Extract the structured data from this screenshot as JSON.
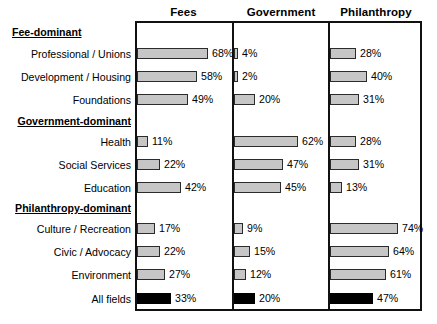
{
  "chart_data": {
    "type": "bar",
    "title": "",
    "subtitle": "",
    "xlabel": "",
    "ylabel": "",
    "xlim": [
      0,
      100
    ],
    "grid": false,
    "legend_position": "none",
    "orientation": "horizontal",
    "value_suffix": "%",
    "panels": [
      "Fees",
      "Government",
      "Philanthropy"
    ],
    "series": [
      {
        "name": "Fees",
        "values": [
          68,
          58,
          49,
          11,
          22,
          42,
          17,
          22,
          27
        ]
      },
      {
        "name": "Government",
        "values": [
          4,
          2,
          20,
          62,
          47,
          45,
          9,
          15,
          12
        ]
      },
      {
        "name": "Philanthropy",
        "values": [
          28,
          40,
          31,
          28,
          31,
          13,
          74,
          64,
          61
        ]
      }
    ],
    "categories": [
      "Professional / Unions",
      "Development / Housing",
      "Foundations",
      "Health",
      "Social Services",
      "Education",
      "Culture / Recreation",
      "Civic / Advocacy",
      "Environment"
    ],
    "groups": [
      {
        "label": "Fee-dominant",
        "categories": [
          "Professional / Unions",
          "Development / Housing",
          "Foundations"
        ]
      },
      {
        "label": "Government-dominant",
        "categories": [
          "Health",
          "Social Services",
          "Education"
        ]
      },
      {
        "label": "Philanthropy-dominant",
        "categories": [
          "Culture / Recreation",
          "Civic / Advocacy",
          "Environment"
        ]
      }
    ],
    "total_row": {
      "label": "All fields",
      "values": [
        33,
        20,
        47
      ]
    }
  },
  "headers": {
    "fees": "Fees",
    "government": "Government",
    "philanthropy": "Philanthropy"
  },
  "groups": {
    "fee_dominant": "Fee-dominant",
    "government_dominant": "Government-dominant",
    "philanthropy_dominant": "Philanthropy-dominant"
  },
  "rows": [
    {
      "label": "Professional / Unions",
      "fees": 68,
      "fees_text": "68%",
      "government": 4,
      "government_text": "4%",
      "philanthropy": 28,
      "philanthropy_text": "28%"
    },
    {
      "label": "Development / Housing",
      "fees": 58,
      "fees_text": "58%",
      "government": 2,
      "government_text": "2%",
      "philanthropy": 40,
      "philanthropy_text": "40%"
    },
    {
      "label": "Foundations",
      "fees": 49,
      "fees_text": "49%",
      "government": 20,
      "government_text": "20%",
      "philanthropy": 31,
      "philanthropy_text": "31%"
    },
    {
      "label": "Health",
      "fees": 11,
      "fees_text": "11%",
      "government": 62,
      "government_text": "62%",
      "philanthropy": 28,
      "philanthropy_text": "28%"
    },
    {
      "label": "Social Services",
      "fees": 22,
      "fees_text": "22%",
      "government": 47,
      "government_text": "47%",
      "philanthropy": 31,
      "philanthropy_text": "31%"
    },
    {
      "label": "Education",
      "fees": 42,
      "fees_text": "42%",
      "government": 45,
      "government_text": "45%",
      "philanthropy": 13,
      "philanthropy_text": "13%"
    },
    {
      "label": "Culture / Recreation",
      "fees": 17,
      "fees_text": "17%",
      "government": 9,
      "government_text": "9%",
      "philanthropy": 74,
      "philanthropy_text": "74%"
    },
    {
      "label": "Civic / Advocacy",
      "fees": 22,
      "fees_text": "22%",
      "government": 15,
      "government_text": "15%",
      "philanthropy": 64,
      "philanthropy_text": "64%"
    },
    {
      "label": "Environment",
      "fees": 27,
      "fees_text": "27%",
      "government": 12,
      "government_text": "12%",
      "philanthropy": 61,
      "philanthropy_text": "61%"
    }
  ],
  "total": {
    "label": "All fields",
    "fees": 33,
    "fees_text": "33%",
    "government": 20,
    "government_text": "20%",
    "philanthropy": 47,
    "philanthropy_text": "47%"
  },
  "colors": {
    "bar_fill": "#c6c6c6",
    "bar_stroke": "#2b2b2b",
    "total_fill": "#000000",
    "frame": "#111111",
    "text": "#000000",
    "background": "#ffffff"
  }
}
